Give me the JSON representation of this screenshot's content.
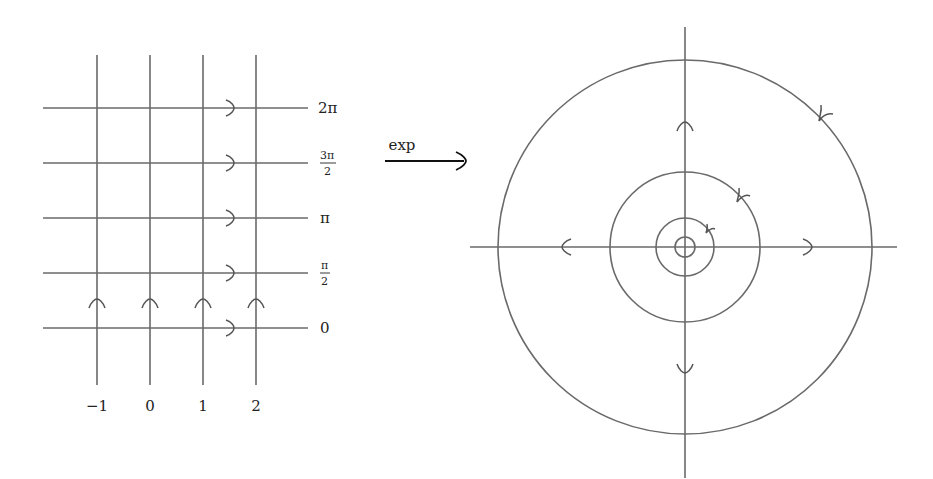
{
  "diagram": {
    "colors": {
      "lines": "#6a6a6a",
      "text": "#222222",
      "background": "#ffffff"
    },
    "left_grid": {
      "description": "Rectangular grid in the z-plane",
      "vertical_lines": [
        {
          "x_value": "-1",
          "label": "−1"
        },
        {
          "x_value": "0",
          "label": "0"
        },
        {
          "x_value": "1",
          "label": "1"
        },
        {
          "x_value": "2",
          "label": "2"
        }
      ],
      "horizontal_lines": [
        {
          "y_value": "2π",
          "label": "2π"
        },
        {
          "y_value": "3π/2",
          "label_num": "3π",
          "label_den": "2"
        },
        {
          "y_value": "π",
          "label": "π"
        },
        {
          "y_value": "π/2",
          "label_num": "π",
          "label_den": "2"
        },
        {
          "y_value": "0",
          "label": "0"
        }
      ],
      "arrow_directions": {
        "horizontal": "right",
        "vertical": "up"
      }
    },
    "map_arrow": {
      "label": "exp",
      "direction": "right"
    },
    "right_plane": {
      "description": "Image under exp: concentric circles and rays through origin",
      "circles_radius": [
        "e^-1",
        "1",
        "e",
        "e^2"
      ],
      "axes": [
        "real",
        "imaginary"
      ],
      "arrow_directions": {
        "rays": "outward from origin",
        "circles": "counterclockwise"
      }
    }
  }
}
